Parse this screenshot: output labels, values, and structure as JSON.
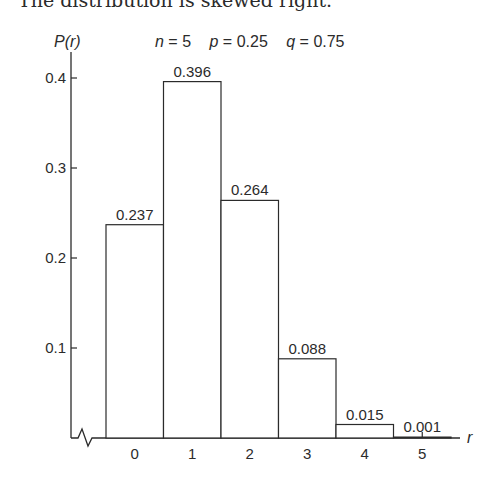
{
  "caption": "The distribution is skewed right.",
  "header": {
    "ylabel": "P(r)",
    "params": [
      {
        "name": "n",
        "value": "5"
      },
      {
        "name": "p",
        "value": "0.25"
      },
      {
        "name": "q",
        "value": "0.75"
      }
    ]
  },
  "chart_data": {
    "type": "bar",
    "title": "n = 5   p = 0.25   q = 0.75",
    "xlabel": "r",
    "ylabel": "P(r)",
    "categories": [
      "0",
      "1",
      "2",
      "3",
      "4",
      "5"
    ],
    "values": [
      0.237,
      0.396,
      0.264,
      0.088,
      0.015,
      0.001
    ],
    "value_labels": [
      "0.237",
      "0.396",
      "0.264",
      "0.088",
      "0.015",
      "0.001"
    ],
    "yticks": [
      "0.1",
      "0.2",
      "0.3",
      "0.4"
    ],
    "ylim": [
      0,
      0.42
    ],
    "grid": false,
    "legend": null,
    "annotations": [
      "axis break on x-axis near origin"
    ],
    "bar_style": {
      "fill": "#ffffff",
      "stroke": "#2b2b2b"
    }
  }
}
